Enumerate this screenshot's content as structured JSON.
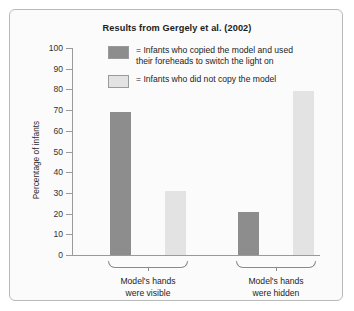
{
  "chart_data": {
    "type": "bar",
    "title": "Results from Gergely et al. (2002)",
    "xlabel": "",
    "ylabel": "Percentage of infants",
    "ylim": [
      0,
      100
    ],
    "ytick_step": 10,
    "yticks": [
      100,
      90,
      80,
      70,
      60,
      50,
      40,
      30,
      20,
      10,
      0
    ],
    "grid": false,
    "legend_position": "top-right-inside",
    "categories": [
      "Model's hands\nwere visible",
      "Model's hands\nwere hidden"
    ],
    "series": [
      {
        "name": "Infants who copied the model and used\ntheir foreheads to switch the light on",
        "color": "#8d8d8d",
        "values": [
          69,
          21
        ]
      },
      {
        "name": "Infants who did not copy the model",
        "color": "#e3e3e3",
        "values": [
          31,
          79
        ]
      }
    ]
  },
  "legend": {
    "equals": "=",
    "rows": [
      {
        "label": "= Infants who copied the model and used\n   their foreheads to switch the light on"
      },
      {
        "label": "= Infants who did not copy the model"
      }
    ]
  },
  "axis": {
    "y_tick_labels": [
      "100",
      "90",
      "80",
      "70",
      "60",
      "50",
      "40",
      "30",
      "20",
      "10",
      "0"
    ]
  },
  "groups": [
    {
      "label": "Model's hands\nwere visible"
    },
    {
      "label": "Model's hands\nwere hidden"
    }
  ]
}
